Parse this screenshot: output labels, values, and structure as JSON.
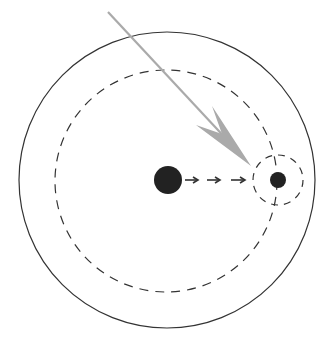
{
  "diagram": {
    "colors": {
      "background": "#ffffff",
      "outline": "#333333",
      "dashed": "#333333",
      "body": "#222222",
      "incoming_arrow": "#aaaaaa"
    },
    "outer_circle": {
      "cx": 167,
      "cy": 180,
      "r": 148
    },
    "orbit_circle": {
      "cx": 166,
      "cy": 181,
      "r": 111
    },
    "central_body": {
      "cx": 168,
      "cy": 180,
      "r": 14
    },
    "orbiting_body": {
      "cx": 278,
      "cy": 180,
      "r": 8
    },
    "influence_circle": {
      "cx": 278,
      "cy": 180,
      "r": 25
    },
    "small_arrows": 3,
    "incoming_arrow": {
      "x1": 108,
      "y1": 12,
      "x2": 251,
      "y2": 166
    }
  }
}
